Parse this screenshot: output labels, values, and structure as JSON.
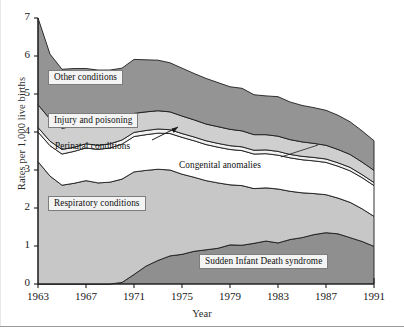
{
  "chart_data": {
    "type": "area",
    "title": "",
    "xlabel": "Year",
    "ylabel": "Rates per 1,000 live births",
    "xlim": [
      1963,
      1991
    ],
    "ylim": [
      0,
      7
    ],
    "grid": false,
    "legend_position": "inline-annotations",
    "stacked": true,
    "x": [
      1963,
      1964,
      1965,
      1966,
      1967,
      1968,
      1969,
      1970,
      1971,
      1972,
      1973,
      1974,
      1975,
      1976,
      1977,
      1978,
      1979,
      1980,
      1981,
      1982,
      1983,
      1984,
      1985,
      1986,
      1987,
      1988,
      1989,
      1990,
      1991
    ],
    "xticks": [
      1963,
      1967,
      1971,
      1975,
      1979,
      1983,
      1987,
      1991
    ],
    "yticks": [
      0,
      1,
      2,
      3,
      4,
      5,
      6,
      7
    ],
    "series": [
      {
        "name": "Sudden Infant Death syndrome",
        "color": "#8f8f8f",
        "values": [
          0.0,
          0.0,
          0.0,
          0.0,
          0.0,
          0.0,
          0.0,
          0.04,
          0.25,
          0.47,
          0.62,
          0.74,
          0.78,
          0.86,
          0.9,
          0.94,
          1.03,
          1.02,
          1.07,
          1.13,
          1.08,
          1.17,
          1.22,
          1.3,
          1.35,
          1.32,
          1.22,
          1.12,
          0.99
        ]
      },
      {
        "name": "Respiratory conditions",
        "color": "#c7c7c7",
        "values": [
          3.22,
          2.84,
          2.6,
          2.65,
          2.72,
          2.66,
          2.68,
          2.72,
          2.7,
          2.52,
          2.4,
          2.26,
          2.11,
          1.95,
          1.82,
          1.72,
          1.58,
          1.57,
          1.44,
          1.4,
          1.42,
          1.27,
          1.18,
          1.08,
          1.0,
          0.94,
          0.93,
          0.86,
          0.79
        ]
      },
      {
        "name": "Congenital anomalies",
        "color": "#ffffff",
        "values": [
          0.78,
          0.8,
          0.82,
          0.84,
          0.86,
          0.88,
          0.9,
          0.92,
          0.93,
          0.94,
          0.95,
          0.96,
          0.97,
          0.96,
          0.95,
          0.94,
          0.93,
          0.92,
          0.91,
          0.9,
          0.89,
          0.88,
          0.87,
          0.86,
          0.85,
          0.84,
          0.83,
          0.82,
          0.81
        ]
      },
      {
        "name": "Perinatal conditions",
        "color": "#f2f2f2",
        "values": [
          0.12,
          0.12,
          0.12,
          0.11,
          0.11,
          0.11,
          0.11,
          0.11,
          0.11,
          0.11,
          0.11,
          0.1,
          0.1,
          0.1,
          0.1,
          0.1,
          0.1,
          0.1,
          0.1,
          0.1,
          0.1,
          0.09,
          0.09,
          0.09,
          0.09,
          0.09,
          0.09,
          0.08,
          0.08
        ]
      },
      {
        "name": "Injury and poisoning",
        "color": "#cfcfcf",
        "values": [
          0.6,
          0.58,
          0.56,
          0.55,
          0.54,
          0.53,
          0.52,
          0.51,
          0.5,
          0.49,
          0.48,
          0.47,
          0.46,
          0.45,
          0.44,
          0.44,
          0.43,
          0.42,
          0.41,
          0.4,
          0.4,
          0.39,
          0.38,
          0.37,
          0.36,
          0.35,
          0.34,
          0.33,
          0.32
        ]
      },
      {
        "name": "Other conditions",
        "color": "#949494",
        "values": [
          2.28,
          1.71,
          1.55,
          1.52,
          1.44,
          1.45,
          1.42,
          1.38,
          1.42,
          1.37,
          1.33,
          1.29,
          1.26,
          1.22,
          1.2,
          1.16,
          1.12,
          1.12,
          1.05,
          1.02,
          1.04,
          0.99,
          0.96,
          0.94,
          0.92,
          0.9,
          0.86,
          0.82,
          0.78
        ]
      }
    ],
    "totals": [
      7.0,
      6.05,
      5.65,
      5.67,
      5.67,
      5.63,
      5.63,
      5.68,
      5.91,
      5.9,
      5.89,
      5.82,
      5.68,
      5.54,
      5.41,
      5.3,
      5.19,
      5.15,
      4.98,
      4.95,
      4.93,
      4.79,
      4.7,
      4.64,
      4.57,
      4.44,
      4.27,
      4.03,
      3.77
    ],
    "annotations": [
      {
        "id": "other-conditions",
        "text": "Other conditions",
        "style": "boxed",
        "x_px": 48,
        "y_px": 70
      },
      {
        "id": "injury-and-poisoning",
        "text": "Injury and poisoning",
        "style": "boxed",
        "x_px": 48,
        "y_px": 113
      },
      {
        "id": "perinatal-conditions",
        "text": "Perinatal conditions",
        "style": "plain",
        "x_px": 55,
        "y_px": 141
      },
      {
        "id": "congenital-anomalies",
        "text": "Congenital anomalies",
        "style": "plain",
        "x_px": 179,
        "y_px": 160
      },
      {
        "id": "respiratory-conditions",
        "text": "Respiratory conditions",
        "style": "boxed",
        "x_px": 48,
        "y_px": 196
      },
      {
        "id": "sudden-infant-death-syndrome",
        "text": "Sudden Infant Death syndrome",
        "style": "boxed",
        "x_px": 199,
        "y_px": 254
      }
    ]
  },
  "axes": {
    "y_tick_labels": [
      "0",
      "1",
      "2",
      "3",
      "4",
      "5",
      "6",
      "7"
    ],
    "x_tick_labels": [
      "1963",
      "1967",
      "1971",
      "1975",
      "1979",
      "1983",
      "1987",
      "1991"
    ],
    "y_axis_title": "Rates per 1,000 live births",
    "x_axis_title": "Year"
  }
}
